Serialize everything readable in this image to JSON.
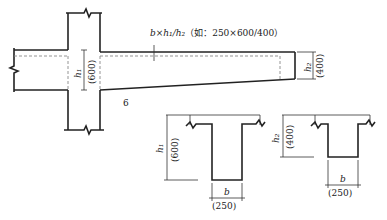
{
  "diagram": {
    "annotation": "b × h₁ / h₂（如：250×600/400）",
    "annotation_parts": {
      "formula": "b×h₁/h₂",
      "example_prefix": "（如：",
      "example": "250×600/400",
      "example_suffix": "）"
    },
    "elevation": {
      "h1_label": "h₁",
      "h1_value": "(600)",
      "h2_label": "h₂",
      "h2_value": "(400)",
      "figure_number": "6"
    },
    "section_root": {
      "h_label": "h₁",
      "h_value": "(600)",
      "b_label": "b",
      "b_value": "(250)"
    },
    "section_tip": {
      "h_label": "h₂",
      "h_value": "(400)",
      "b_label": "b",
      "b_value": "(250)"
    }
  }
}
